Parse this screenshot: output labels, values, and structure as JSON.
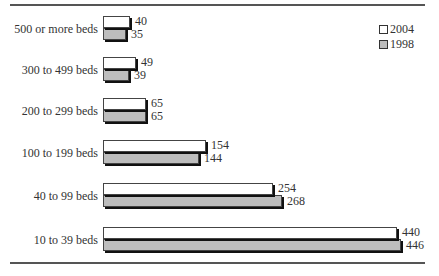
{
  "chart_data": {
    "type": "bar",
    "orientation": "horizontal",
    "title": "",
    "xlabel": "",
    "ylabel": "",
    "categories": [
      "500 or more beds",
      "300 to 499 beds",
      "200 to 299 beds",
      "100 to 199 beds",
      "40 to 99 beds",
      "10 to 39 beds"
    ],
    "series": [
      {
        "name": "2004",
        "color": "#ffffff",
        "values": [
          40,
          49,
          65,
          154,
          254,
          440
        ]
      },
      {
        "name": "1998",
        "color": "#bdbdbd",
        "values": [
          35,
          39,
          65,
          144,
          268,
          446
        ]
      }
    ],
    "grid": false,
    "legend_position": "top-right",
    "data_labels": true
  },
  "legend": [
    {
      "label": "2004",
      "color": "#ffffff"
    },
    {
      "label": "1998",
      "color": "#bdbdbd"
    }
  ]
}
